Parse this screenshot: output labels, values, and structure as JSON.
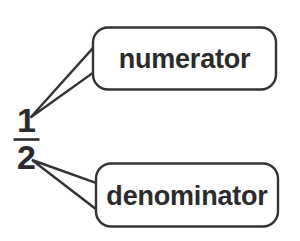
{
  "diagram": {
    "type": "annotated-fraction-diagram",
    "background_color": "#ffffff",
    "stroke_color": "#333333",
    "text_color": "#2b2b2b",
    "fraction": {
      "numerator": "1",
      "denominator": "2",
      "bar_label": "fraction-bar"
    },
    "callouts": [
      {
        "id": "numerator-callout",
        "label": "numerator",
        "points_to": "numerator",
        "position": "upper-right"
      },
      {
        "id": "denominator-callout",
        "label": "denominator",
        "points_to": "denominator",
        "position": "lower-right"
      }
    ]
  }
}
